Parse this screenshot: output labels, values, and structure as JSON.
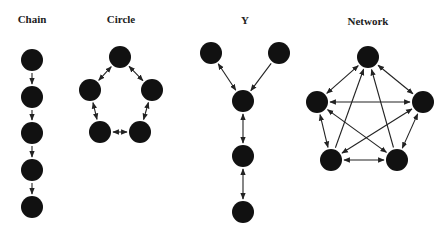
{
  "titles": {
    "chain": "Chain",
    "circle": "Circle",
    "y": "Y",
    "network": "Network"
  },
  "colors": {
    "node": "#111111",
    "edge": "#222222",
    "background": "#ffffff"
  },
  "diagrams": {
    "chain": {
      "nodes": [
        [
          32,
          60
        ],
        [
          32,
          97
        ],
        [
          32,
          133
        ],
        [
          32,
          170
        ],
        [
          32,
          207
        ]
      ],
      "edges": [
        [
          0,
          1,
          "one"
        ],
        [
          1,
          2,
          "one"
        ],
        [
          2,
          3,
          "one"
        ],
        [
          3,
          4,
          "one"
        ]
      ]
    },
    "circle": {
      "nodes": [
        [
          120,
          57
        ],
        [
          90,
          90
        ],
        [
          152,
          90
        ],
        [
          100,
          132
        ],
        [
          140,
          132
        ]
      ],
      "edges": [
        [
          0,
          1,
          "both"
        ],
        [
          0,
          2,
          "both"
        ],
        [
          1,
          3,
          "both"
        ],
        [
          2,
          4,
          "both"
        ],
        [
          3,
          4,
          "both"
        ]
      ]
    },
    "y": {
      "nodes": [
        [
          211,
          53
        ],
        [
          279,
          53
        ],
        [
          243,
          101
        ],
        [
          243,
          156
        ],
        [
          243,
          212
        ]
      ],
      "edges": [
        [
          0,
          2,
          "both"
        ],
        [
          1,
          2,
          "one"
        ],
        [
          2,
          3,
          "both"
        ],
        [
          3,
          4,
          "both"
        ]
      ]
    },
    "network": {
      "nodes": [
        [
          368,
          57
        ],
        [
          317,
          102
        ],
        [
          423,
          102
        ],
        [
          331,
          160
        ],
        [
          397,
          160
        ]
      ],
      "edges": [
        [
          0,
          1,
          "both"
        ],
        [
          0,
          2,
          "both"
        ],
        [
          0,
          3,
          "one-rev"
        ],
        [
          0,
          4,
          "one-rev"
        ],
        [
          1,
          2,
          "both"
        ],
        [
          1,
          3,
          "both"
        ],
        [
          1,
          4,
          "both"
        ],
        [
          2,
          3,
          "both"
        ],
        [
          2,
          4,
          "both"
        ],
        [
          3,
          4,
          "both"
        ]
      ]
    }
  },
  "node_radius": 11
}
